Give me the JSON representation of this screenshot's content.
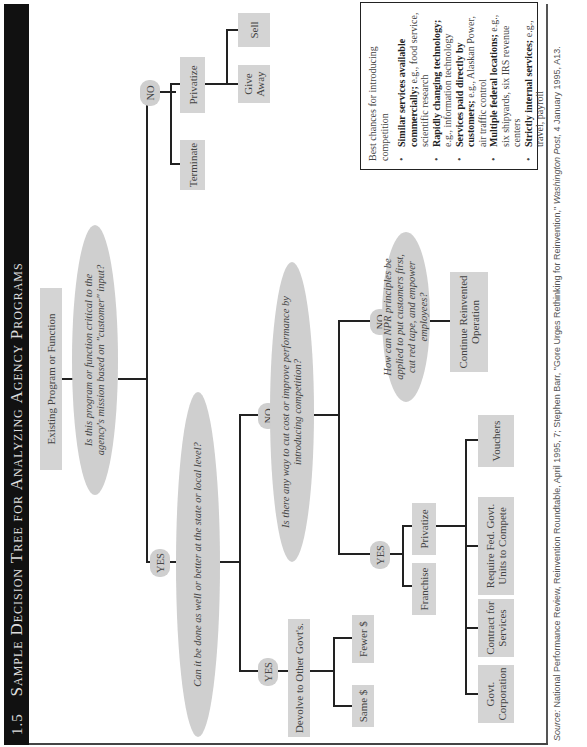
{
  "figure": {
    "number": "1.5",
    "title_words": [
      {
        "big": "S",
        "small": "ample"
      },
      {
        "big": "D",
        "small": "ecision"
      },
      {
        "big": "T",
        "small": "ree"
      },
      {
        "big": "",
        "small": "for"
      },
      {
        "big": "A",
        "small": "nalyzing"
      },
      {
        "big": "A",
        "small": "gency"
      },
      {
        "big": "P",
        "small": "rograms"
      }
    ],
    "title_text": "Sample Decision Tree for Analyzing Agency Programs"
  },
  "tree": {
    "root": "Existing Program or Function",
    "q1": "Is this program or function critical to the agency's mission based on \"customer\" input?",
    "q1_no": "NO",
    "q1_yes": "YES",
    "terminate": "Terminate",
    "privatize_top": "Privatize",
    "sell": "Sell",
    "give_away": "Give Away",
    "q2": "Can it be done as well or better at the state or local level?",
    "q2_yes": "YES",
    "q2_no": "NO",
    "devolve": "Devolve to Other Govt's.",
    "same": "Same $",
    "fewer": "Fewer $",
    "q3": "Is there any way to cut cost or improve performance by introducing competition?",
    "q3_yes": "YES",
    "q3_no": "NO",
    "franchise": "Franchise",
    "privatize_bottom": "Privatize",
    "govt_corp": "Govt. Corporation",
    "contract": "Contract for Services",
    "require_fed": "Require Fed. Govt. Units to Compete",
    "vouchers": "Vouchers",
    "q4": "How can NPR principles be applied to put customers first, cut red tape, and empower employees?",
    "continue": "Continue Reinvented Operation"
  },
  "sidebar_note": {
    "heading": "Best chances for introducing competition",
    "items": [
      {
        "bold": "Similar services available commercially;",
        "rest": " e.g., food service, scientific research"
      },
      {
        "bold": "Rapidly changing technology;",
        "rest": " e.g., information technology"
      },
      {
        "bold": "Services paid directly by customers;",
        "rest": " e.g., Alaskan Power, air traffic control"
      },
      {
        "bold": "Multiple federal locations;",
        "rest": " e.g., six shipyards, six IRS revenue centers"
      },
      {
        "bold": "Strictly internal services;",
        "rest": " e.g., travel, payroll"
      }
    ]
  },
  "source": {
    "label": "Source:",
    "text": " National Performance Review, Reinvention Roundtable, April 1995, 7; Stephen Barr, \"Gore Urges Rethinking for Reinvention,\" ",
    "publication": "Washington Post,",
    "tail": " 4 January 1995, A13."
  },
  "colors": {
    "title_bar": "#111111",
    "node_fill": "#d4d4d4",
    "line": "#222222"
  }
}
